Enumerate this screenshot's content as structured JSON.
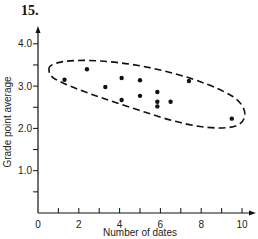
{
  "figure": {
    "number": "15."
  },
  "chart_data": {
    "type": "scatter",
    "title": "",
    "xlabel": "Number of dates",
    "ylabel": "Grade point average",
    "xlim": [
      0,
      10.5
    ],
    "ylim": [
      0,
      4.3
    ],
    "x_ticks": [
      0,
      2,
      4,
      6,
      8,
      10
    ],
    "x_ticks_minor": [
      1,
      3,
      5,
      7,
      9
    ],
    "y_ticks": [
      1.0,
      2.0,
      3.0,
      4.0
    ],
    "y_ticks_minor": [
      0.5,
      1.5,
      2.5,
      3.5
    ],
    "x_tick_labels": [
      "0",
      "2",
      "4",
      "6",
      "8",
      "10"
    ],
    "y_tick_labels": [
      "1.0",
      "2.0",
      "3.0",
      "4.0"
    ],
    "grid": false,
    "legend": null,
    "annotations": [
      "Dashed ellipse enclosing all data points, tilted downward (negative correlation)"
    ],
    "points": [
      {
        "x": 1.3,
        "y": 3.15
      },
      {
        "x": 2.4,
        "y": 3.4
      },
      {
        "x": 3.3,
        "y": 2.98
      },
      {
        "x": 4.1,
        "y": 3.19
      },
      {
        "x": 4.1,
        "y": 2.67
      },
      {
        "x": 5.0,
        "y": 3.14
      },
      {
        "x": 5.0,
        "y": 2.77
      },
      {
        "x": 5.85,
        "y": 2.86
      },
      {
        "x": 5.85,
        "y": 2.63
      },
      {
        "x": 5.85,
        "y": 2.52
      },
      {
        "x": 6.5,
        "y": 2.63
      },
      {
        "x": 7.4,
        "y": 3.12
      },
      {
        "x": 9.5,
        "y": 2.23
      }
    ]
  }
}
